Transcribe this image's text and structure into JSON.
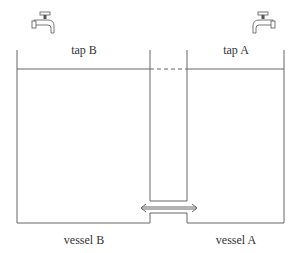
{
  "diagram": {
    "labels": {
      "tap_b": "tap B",
      "tap_a": "tap A",
      "vessel_b": "vessel B",
      "vessel_a": "vessel A"
    },
    "colors": {
      "line": "#666666",
      "text": "#333333"
    }
  }
}
